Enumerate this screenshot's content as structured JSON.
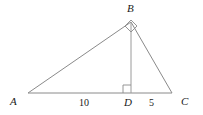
{
  "figure": {
    "type": "geometry-diagram",
    "shape": "right-triangle-with-altitude",
    "background_color": "#ffffff",
    "stroke_color": "#8a8a8a",
    "text_color": "#1a1a1a",
    "width": 203,
    "height": 115
  },
  "vertices": {
    "A": {
      "label": "A",
      "x": 28,
      "y": 93
    },
    "B": {
      "label": "B",
      "x": 131,
      "y": 22
    },
    "C": {
      "label": "C",
      "x": 172,
      "y": 93
    },
    "D": {
      "label": "D",
      "x": 131,
      "y": 93
    }
  },
  "segments": [
    {
      "name": "AB",
      "from": "A",
      "to": "B"
    },
    {
      "name": "BC",
      "from": "B",
      "to": "C"
    },
    {
      "name": "AC",
      "from": "A",
      "to": "C"
    },
    {
      "name": "BD",
      "from": "B",
      "to": "D"
    }
  ],
  "measures": {
    "AD": "10",
    "DC": "5"
  },
  "right_angles": [
    {
      "at": "B",
      "style": "rotated-square"
    },
    {
      "at": "D",
      "style": "axis-aligned-square"
    }
  ]
}
